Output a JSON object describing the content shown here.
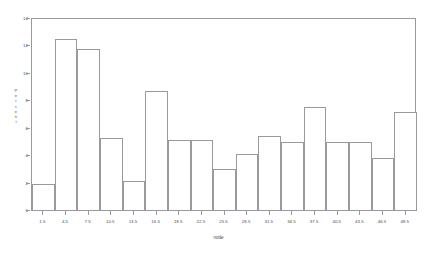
{
  "chart_data": {
    "type": "bar",
    "title": "",
    "subtitle": "",
    "xlabel": "node",
    "ylabel": "Percent",
    "categories": [
      "1.5",
      "4.5",
      "7.5",
      "10.5",
      "13.5",
      "16.5",
      "19.5",
      "22.5",
      "25.5",
      "28.5",
      "31.5",
      "34.5",
      "37.5",
      "40.5",
      "43.5",
      "46.5",
      "49.5"
    ],
    "values": [
      2.0,
      12.55,
      11.85,
      5.35,
      2.2,
      8.75,
      5.15,
      5.2,
      3.1,
      4.15,
      5.45,
      5.05,
      7.6,
      5.05,
      5.05,
      3.9,
      7.25
    ],
    "ylim": [
      0,
      14
    ],
    "yticks": [
      0,
      2,
      4,
      6,
      8,
      10,
      12,
      14
    ],
    "ytick_labels": [
      "0",
      "2",
      "4",
      "6",
      "8",
      "10",
      "12",
      "14"
    ],
    "xlim": [
      0,
      51
    ],
    "bin_width": 3,
    "grid": false,
    "legend": null,
    "legend_position": "none",
    "series": [
      {
        "name": "Percent",
        "values": [
          2.0,
          12.55,
          11.85,
          5.35,
          2.2,
          8.75,
          5.15,
          5.2,
          3.1,
          4.15,
          5.45,
          5.05,
          7.6,
          5.05,
          5.05,
          3.9,
          7.25
        ]
      }
    ],
    "colors": {
      "bar_fill": "#ffffff",
      "bar_stroke": "#9a9a9e",
      "axis": "#9a9a9e",
      "text": "#4a4b4f",
      "background": "#ffffff"
    }
  },
  "ylabel_letters": [
    "P",
    "e",
    "r",
    "c",
    "e",
    "n",
    "t"
  ]
}
